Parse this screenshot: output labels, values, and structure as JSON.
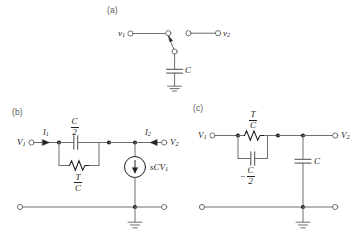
{
  "figure": {
    "background_color": "#ffffff",
    "wire_color": "#6d6e71",
    "ink_color": "#231f20"
  },
  "panels": [
    {
      "id": "a",
      "label": "(a)",
      "description": "Switched capacitor between two terminals",
      "nodes": [
        {
          "name": "v1",
          "label": "v",
          "subscript": "1",
          "type": "open-terminal"
        },
        {
          "name": "v2",
          "label": "v",
          "subscript": "2",
          "type": "open-terminal"
        }
      ],
      "components": [
        {
          "name": "switch",
          "type": "spdt-switch",
          "label": ""
        },
        {
          "name": "capacitor-c",
          "type": "capacitor",
          "label": "C"
        },
        {
          "name": "ground",
          "type": "ground",
          "label": ""
        }
      ]
    },
    {
      "id": "b",
      "label": "(b)",
      "description": "Equivalent circuit with C/2 capacitor, T/C resistor and dependent current source",
      "nodes": [
        {
          "name": "v1",
          "label": "V",
          "subscript": "1",
          "type": "open-terminal"
        },
        {
          "name": "v2",
          "label": "V",
          "subscript": "2",
          "type": "open-terminal"
        }
      ],
      "currents": [
        {
          "name": "i1",
          "label": "I",
          "subscript": "1",
          "direction": "right"
        },
        {
          "name": "i2",
          "label": "I",
          "subscript": "2",
          "direction": "left"
        }
      ],
      "components": [
        {
          "name": "capacitor-c-over-2",
          "type": "capacitor",
          "numerator": "C",
          "denominator": "2",
          "sign": ""
        },
        {
          "name": "resistor-t-over-c",
          "type": "resistor",
          "numerator": "T",
          "denominator": "C",
          "sign": ""
        },
        {
          "name": "current-source-scv1",
          "type": "dependent-current-source",
          "label": "sCV",
          "subscript": "1",
          "arrow": "down"
        },
        {
          "name": "ground",
          "type": "ground",
          "label": ""
        }
      ]
    },
    {
      "id": "c",
      "label": "(c)",
      "description": "Equivalent circuit with T/C resistor, negative C/2 capacitor and shunt capacitor C",
      "nodes": [
        {
          "name": "v1",
          "label": "V",
          "subscript": "1",
          "type": "open-terminal"
        },
        {
          "name": "v2",
          "label": "V",
          "subscript": "2",
          "type": "open-terminal"
        }
      ],
      "components": [
        {
          "name": "resistor-t-over-c",
          "type": "resistor",
          "numerator": "T",
          "denominator": "C",
          "sign": ""
        },
        {
          "name": "capacitor-negative-c-over-2",
          "type": "capacitor",
          "numerator": "C",
          "denominator": "2",
          "sign": "−"
        },
        {
          "name": "capacitor-c",
          "type": "capacitor",
          "label": "C"
        },
        {
          "name": "ground",
          "type": "ground",
          "label": ""
        }
      ]
    }
  ]
}
